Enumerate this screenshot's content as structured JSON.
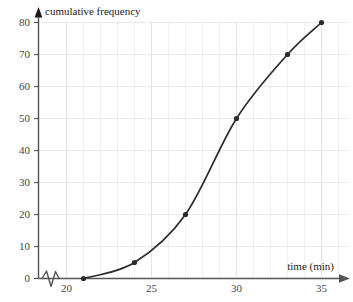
{
  "chart_data": {
    "type": "line",
    "title": "",
    "xlabel": "time (min)",
    "ylabel": "cumulative frequency",
    "x": [
      21,
      24,
      27,
      30,
      33,
      35
    ],
    "values": [
      0,
      5,
      20,
      50,
      70,
      80
    ],
    "series": [
      {
        "name": "cumulative frequency",
        "x": [
          21,
          24,
          27,
          30,
          33,
          35
        ],
        "values": [
          0,
          5,
          20,
          50,
          70,
          80
        ]
      }
    ],
    "xlim": [
      20,
      35
    ],
    "ylim": [
      0,
      80
    ],
    "x_ticks": [
      20,
      25,
      30,
      35
    ],
    "x_tick_labels": [
      "20",
      "25",
      "30",
      "35"
    ],
    "x_minor_step": 1,
    "y_ticks": [
      0,
      10,
      20,
      30,
      40,
      50,
      60,
      70,
      80
    ],
    "y_tick_labels": [
      "0",
      "10",
      "20",
      "30",
      "40",
      "50",
      "60",
      "70",
      "80"
    ],
    "y_minor_step": 10,
    "grid": true,
    "legend": "none",
    "axis_break": {
      "axis": "x",
      "symbol": "zigzag",
      "description": "axis break between origin and 20"
    },
    "curve_style": "smooth",
    "marker": "filled-circle",
    "colors": {
      "curve": "#2b2b2b",
      "marker": "#2b2b2b",
      "axis": "#555555",
      "grid": "#eeeef2",
      "grid_major": "#e4e4ea",
      "text": "#444444",
      "title_text": "#1a1a1a"
    }
  },
  "axes": {
    "y_axis_title": "cumulative frequency",
    "x_axis_title": "time (min)",
    "y_labels": [
      "80",
      "70",
      "60",
      "50",
      "40",
      "30",
      "20",
      "10",
      "0"
    ],
    "x_labels": [
      "20",
      "25",
      "30",
      "35"
    ]
  }
}
